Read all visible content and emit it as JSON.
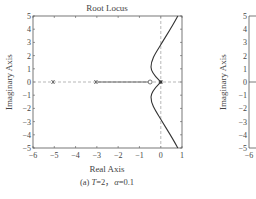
{
  "chart_data": [
    {
      "type": "line",
      "title": "Root Locus",
      "xlabel": "Real Axis",
      "ylabel": "Imaginary Axis",
      "caption": "(a) T=2, α=0.1",
      "xlim": [
        -6,
        1
      ],
      "ylim": [
        -5,
        5
      ],
      "xticks": [
        "-6",
        "-5",
        "-4",
        "-3",
        "-2",
        "-1",
        "0",
        "1"
      ],
      "yticks": [
        "5",
        "4",
        "3",
        "2",
        "1",
        "0",
        "-1",
        "-2",
        "-3",
        "-4",
        "-5"
      ],
      "grid": false,
      "poles": [
        {
          "re": -5,
          "im": 0
        },
        {
          "re": -3,
          "im": 0
        },
        {
          "re": 0,
          "im": 0
        }
      ],
      "zeros": [
        {
          "re": -0.5,
          "im": 0
        }
      ],
      "series": [
        {
          "name": "upper branch",
          "points": [
            [
              0,
              0
            ],
            [
              -0.2,
              0.5
            ],
            [
              -0.45,
              1.0
            ],
            [
              -0.45,
              1.6
            ],
            [
              -0.2,
              2.2
            ],
            [
              0.1,
              2.8
            ],
            [
              0.45,
              3.8
            ],
            [
              0.8,
              5
            ]
          ]
        },
        {
          "name": "lower branch",
          "points": [
            [
              0,
              0
            ],
            [
              -0.2,
              -0.5
            ],
            [
              -0.45,
              -1.0
            ],
            [
              -0.45,
              -1.6
            ],
            [
              -0.2,
              -2.2
            ],
            [
              0.1,
              -2.8
            ],
            [
              0.45,
              -3.8
            ],
            [
              0.8,
              -5
            ]
          ]
        },
        {
          "name": "real axis locus",
          "points": [
            [
              -3,
              0
            ],
            [
              -0.5,
              0
            ]
          ]
        }
      ]
    },
    {
      "type": "line",
      "ylabel": "Imaginary Axis",
      "yticks": [
        "5",
        "4",
        "3",
        "2",
        "1",
        "0",
        "-1",
        "-2",
        "-3",
        "-4",
        "-5"
      ],
      "xticks_visible": [
        "-6"
      ],
      "partial": true
    }
  ],
  "labels": {
    "title": "Root Locus",
    "xlabel": "Real Axis",
    "ylabel": "Imaginary Axis",
    "caption": "(a) T=2，α=0.1",
    "ylabel2": "Imaginary Axis"
  }
}
